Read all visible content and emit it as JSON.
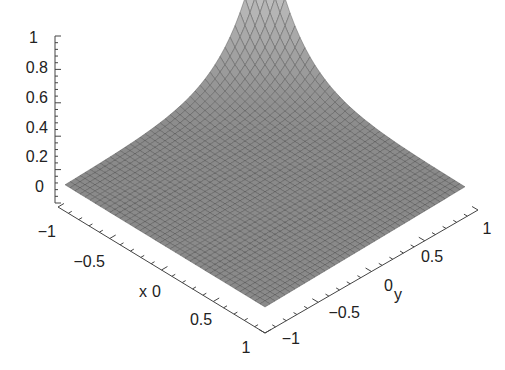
{
  "chart_data": {
    "type": "surface3d",
    "title": "",
    "xlabel": "x",
    "ylabel": "y",
    "zlabel": "",
    "xlim": [
      -1,
      1
    ],
    "ylim": [
      -1,
      1
    ],
    "zlim": [
      0,
      1
    ],
    "x_ticks": [
      "-1",
      "-0.5",
      "0",
      "0.5",
      "1"
    ],
    "y_ticks": [
      "-1",
      "-0.5",
      "0",
      "0.5",
      "1"
    ],
    "z_ticks": [
      "0",
      "0.2",
      "0.4",
      "0.6",
      "0.8",
      "1"
    ],
    "surface_description": "Sharp peak of height 1 at corner (x=-1, y=1) decaying rapidly to ~0; flat near zero elsewhere",
    "peak": {
      "x": -1,
      "y": 1,
      "z": 1
    },
    "grid": "mesh",
    "surface_color": "#8a8a8a",
    "mesh_color": "#3a3a3a"
  },
  "axes": {
    "x_title": "x",
    "y_title": "y"
  }
}
